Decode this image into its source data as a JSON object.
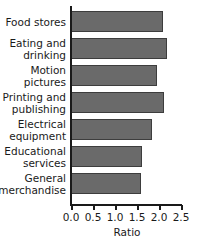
{
  "chart_data": {
    "type": "bar",
    "orientation": "horizontal",
    "title": "",
    "xlabel": "Ratio",
    "ylabel": "",
    "categories": [
      "Food stores",
      "Eating and drinking",
      "Motion pictures",
      "Printing and publishing",
      "Electrical equipment",
      "Educational services",
      "General merchandise"
    ],
    "category_lines": [
      [
        "Food stores"
      ],
      [
        "Eating and",
        "drinking"
      ],
      [
        "Motion",
        "pictures"
      ],
      [
        "Printing and",
        "publishing"
      ],
      [
        "Electrical",
        "equipment"
      ],
      [
        "Educational",
        "services"
      ],
      [
        "General",
        "merchandise"
      ]
    ],
    "values": [
      2.09,
      2.19,
      1.95,
      2.12,
      1.84,
      1.61,
      1.59
    ],
    "xlim": [
      0.0,
      2.5
    ],
    "xticks": [
      0.0,
      0.5,
      1.0,
      1.5,
      2.0,
      2.5
    ],
    "xticklabels": [
      "0.0",
      "0.5",
      "1.0",
      "1.5",
      "2.0",
      "2.5"
    ],
    "grid": false,
    "legend": null,
    "colors": {
      "bar_fill": "#6a6a6a",
      "bar_edge": "#3d3d3d",
      "axis": "#1a1a1a",
      "text": "#1a1a1a",
      "background": "#ffffff"
    }
  }
}
